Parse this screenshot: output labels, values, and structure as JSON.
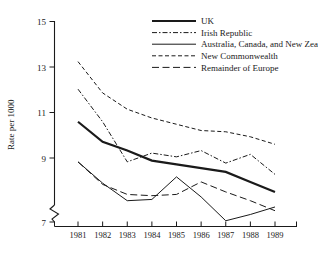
{
  "chart_data": {
    "type": "line",
    "title": "",
    "xlabel": "",
    "ylabel": "Rate per 1000",
    "x": [
      "1981",
      "1982",
      "1983",
      "1984",
      "1985",
      "1986",
      "1987",
      "1988",
      "1989"
    ],
    "categories": [
      "1981",
      "1982",
      "1983",
      "1984",
      "1985",
      "1986",
      "1987",
      "1988",
      "1989"
    ],
    "ylim": [
      7,
      15
    ],
    "yticks": [
      "7",
      "9",
      "11",
      "13",
      "15"
    ],
    "ytick_values": [
      7,
      9,
      11,
      13,
      15
    ],
    "axis_break": true,
    "axis_break_note": "y-axis broken below 7",
    "grid": false,
    "legend_position": "top-center",
    "series": [
      {
        "name": "UK",
        "style": "solid-thick",
        "values": [
          11.0,
          10.2,
          9.85,
          9.45,
          9.3,
          9.15,
          9.0,
          8.6,
          8.2
        ]
      },
      {
        "name": "Irish Republic",
        "style": "dash-dot",
        "values": [
          12.3,
          11.0,
          9.4,
          9.75,
          9.6,
          9.85,
          9.35,
          9.7,
          8.9
        ]
      },
      {
        "name": "Australia, Canada, and New Zealand,",
        "style": "solid-thin",
        "values": [
          9.4,
          8.55,
          7.85,
          7.9,
          8.8,
          8.0,
          7.05,
          7.3,
          7.6
        ]
      },
      {
        "name": "New Commonwealth",
        "style": "dashed-short",
        "values": [
          13.4,
          12.15,
          11.5,
          11.15,
          10.9,
          10.65,
          10.6,
          10.4,
          10.1
        ]
      },
      {
        "name": "Remainder of Europe",
        "style": "dashed-long",
        "values": [
          9.4,
          8.5,
          8.1,
          8.05,
          8.1,
          8.6,
          8.2,
          7.85,
          7.45
        ]
      }
    ]
  },
  "legend": {
    "items": [
      {
        "label": "UK",
        "style": "solid-thick"
      },
      {
        "label": "Irish Republic",
        "style": "dash-dot"
      },
      {
        "label": "Australia, Canada, and New Zealand,",
        "style": "solid-thin"
      },
      {
        "label": "New Commonwealth",
        "style": "dashed-short"
      },
      {
        "label": "Remainder of Europe",
        "style": "dashed-long"
      }
    ]
  },
  "colors": {
    "ink": "#1a1a1a",
    "background": "#ffffff"
  }
}
